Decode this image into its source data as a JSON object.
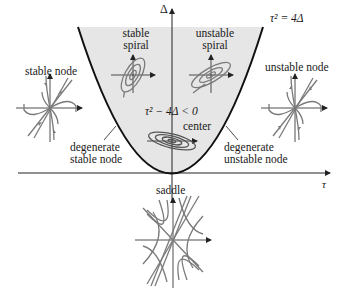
{
  "diagram": {
    "axes": {
      "horizontal_label": "τ",
      "vertical_label": "Δ"
    },
    "curve_label": "τ² = 4Δ",
    "region_label": "τ² − 4Δ < 0",
    "colors": {
      "shaded_region": "#e6e6e6",
      "curve": "#111111",
      "trajectory": "#7a7a7a",
      "axis": "#222222",
      "text": "#1a1a1a"
    },
    "labels": {
      "stable_spiral": [
        "stable",
        "spiral"
      ],
      "unstable_spiral": [
        "unstable",
        "spiral"
      ],
      "stable_node": "stable node",
      "unstable_node": "unstable node",
      "center": "center",
      "degenerate_stable_node": [
        "degenerate",
        "stable node"
      ],
      "degenerate_unstable_node": [
        "degenerate",
        "unstable node"
      ],
      "saddle": "saddle"
    },
    "phase_portraits": [
      {
        "name": "stable spiral",
        "region": "upper-left inside parabola"
      },
      {
        "name": "unstable spiral",
        "region": "upper-right inside parabola"
      },
      {
        "name": "center",
        "region": "on Δ axis, τ = 0"
      },
      {
        "name": "stable node",
        "region": "left, outside parabola"
      },
      {
        "name": "unstable node",
        "region": "right, outside parabola"
      },
      {
        "name": "saddle",
        "region": "below τ axis, Δ < 0"
      }
    ]
  }
}
